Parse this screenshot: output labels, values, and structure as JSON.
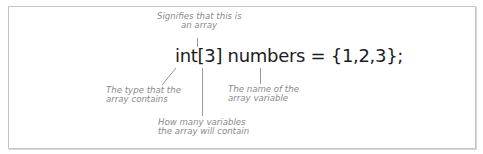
{
  "code": {
    "statement": "int[3] numbers = {1,2,3};"
  },
  "annotations": {
    "array_marker": {
      "lines": [
        "Signifies that this is",
        "an array"
      ]
    },
    "element_type": {
      "lines": [
        "The type that the",
        "array contains"
      ]
    },
    "element_count": {
      "lines": [
        "How many variables",
        "the array will contain"
      ]
    },
    "variable_name": {
      "lines": [
        "The name of the",
        "array variable"
      ]
    }
  },
  "colors": {
    "code_text": "#1c1c1c",
    "annotation_text": "#8a8a8a",
    "leader_line": "#9a9a9a",
    "frame_border": "#c4c4c4"
  }
}
